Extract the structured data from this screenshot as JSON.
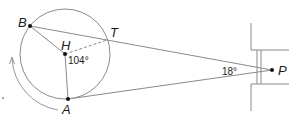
{
  "diagram": {
    "type": "geometry",
    "points": {
      "B": {
        "label": "B",
        "x": 30,
        "y": 26
      },
      "H": {
        "label": "H",
        "x": 65,
        "y": 54
      },
      "T": {
        "label": "T",
        "x": 107,
        "y": 40
      },
      "A": {
        "label": "A",
        "x": 68,
        "y": 99
      },
      "P": {
        "label": "P",
        "x": 272,
        "y": 70
      }
    },
    "angles": {
      "center_angle": "104°",
      "apex_angle": "18°"
    },
    "colors": {
      "line": "#8a8a8a",
      "point": "#111111",
      "text": "#1a1a1a"
    }
  }
}
